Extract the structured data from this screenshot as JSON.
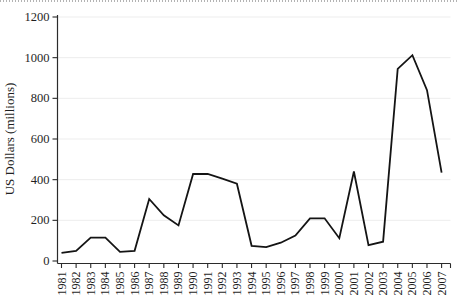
{
  "chart_data": {
    "type": "line",
    "title": "",
    "xlabel": "",
    "ylabel": "US Dollars (millions)",
    "x": [
      1981,
      1982,
      1983,
      1984,
      1985,
      1986,
      1987,
      1988,
      1989,
      1990,
      1991,
      1992,
      1993,
      1994,
      1995,
      1996,
      1997,
      1998,
      1999,
      2000,
      2001,
      2002,
      2003,
      2004,
      2005,
      2006,
      2007
    ],
    "series": [
      {
        "name": "US Dollars (millions)",
        "values": [
          40,
          50,
          115,
          115,
          45,
          50,
          305,
          225,
          175,
          428,
          428,
          405,
          380,
          75,
          68,
          90,
          125,
          210,
          210,
          112,
          440,
          78,
          95,
          945,
          1012,
          840,
          435
        ]
      }
    ],
    "ylim": [
      0,
      1200
    ],
    "yticks": [
      0,
      200,
      400,
      600,
      800,
      1000,
      1200
    ],
    "grid": "faint horizontal gridlines at each y tick",
    "legend": "none",
    "line_color": "#141414",
    "gridline_color": "#ededed",
    "axis_color": "#2b2b2b"
  }
}
